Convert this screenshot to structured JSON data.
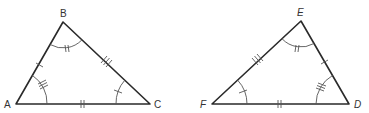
{
  "diagram": {
    "colors": {
      "line": "#2a2a2a",
      "mark": "#555555",
      "label": "#333333"
    },
    "triangles": [
      {
        "name": "ABC",
        "vertices": [
          {
            "label": "A",
            "x": 16,
            "y": 104
          },
          {
            "label": "B",
            "x": 63,
            "y": 22
          },
          {
            "label": "C",
            "x": 150,
            "y": 104
          }
        ],
        "side_marks": {
          "AB": 1,
          "BC": 3,
          "AC": 2
        },
        "angle_marks": {
          "A": 3,
          "B": 2,
          "C": 1
        }
      },
      {
        "name": "DEF",
        "vertices": [
          {
            "label": "F",
            "x": 212,
            "y": 104
          },
          {
            "label": "E",
            "x": 301,
            "y": 21
          },
          {
            "label": "D",
            "x": 349,
            "y": 104
          }
        ],
        "side_marks": {
          "ED": 1,
          "FE": 3,
          "FD": 2
        },
        "angle_marks": {
          "D": 3,
          "E": 2,
          "F": 1
        }
      }
    ]
  },
  "labels": {
    "A": "A",
    "B": "B",
    "C": "C",
    "D": "D",
    "E": "E",
    "F": "F"
  }
}
